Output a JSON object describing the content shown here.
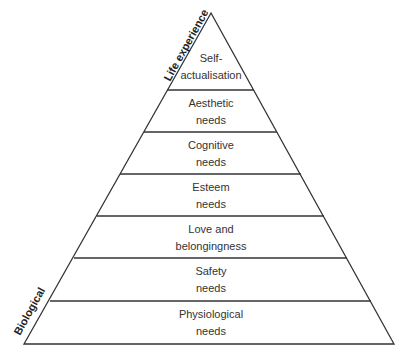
{
  "diagram": {
    "axis_top_label": "Life experience",
    "axis_bottom_label": "Biological",
    "levels": [
      {
        "line1": "Self-",
        "line2": "actualisation"
      },
      {
        "line1": "Aesthetic",
        "line2": "needs"
      },
      {
        "line1": "Cognitive",
        "line2": "needs"
      },
      {
        "line1": "Esteem",
        "line2": "needs"
      },
      {
        "line1": "Love and",
        "line2": "belongingness"
      },
      {
        "line1": "Safety",
        "line2": "needs"
      },
      {
        "line1": "Physiological",
        "line2": "needs"
      }
    ],
    "colors": {
      "stroke": "#333333",
      "text": "#333333",
      "background": "#ffffff"
    }
  }
}
